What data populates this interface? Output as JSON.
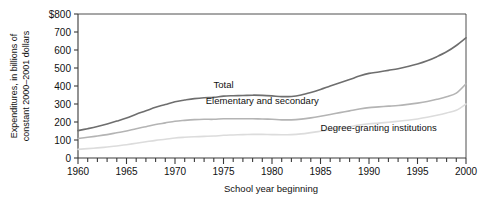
{
  "chart_data": {
    "type": "line",
    "title": "",
    "subtitle": "",
    "xlabel": "School year beginning",
    "ylabel": "Expenditures, in billions of constant 2000–2001 dollars",
    "ylabel_line1": "Expenditures, in billions of",
    "ylabel_line2": "constant 2000–2001 dollars",
    "xlim": [
      1960,
      2000
    ],
    "ylim": [
      0,
      800
    ],
    "ytick_values": [
      0,
      100,
      200,
      300,
      400,
      500,
      600,
      700,
      800
    ],
    "ytick_labels": [
      "0",
      "100",
      "200",
      "300",
      "400",
      "500",
      "600",
      "700",
      "$800"
    ],
    "xtick_values": [
      1960,
      1961,
      1962,
      1963,
      1964,
      1965,
      1966,
      1967,
      1968,
      1969,
      1970,
      1971,
      1972,
      1973,
      1974,
      1975,
      1976,
      1977,
      1978,
      1979,
      1980,
      1981,
      1982,
      1983,
      1984,
      1985,
      1986,
      1987,
      1988,
      1989,
      1990,
      1991,
      1992,
      1993,
      1994,
      1995,
      1996,
      1997,
      1998,
      1999,
      2000
    ],
    "xtick_labels": [
      "1960",
      "1965",
      "1970",
      "1975",
      "1980",
      "1985",
      "1990",
      "1995",
      "2000"
    ],
    "xtick_labeled_values": [
      1960,
      1965,
      1970,
      1975,
      1980,
      1985,
      1990,
      1995,
      2000
    ],
    "grid": false,
    "legend_position": "inline-annotations",
    "x": [
      1960,
      1961,
      1962,
      1963,
      1964,
      1965,
      1966,
      1967,
      1968,
      1969,
      1970,
      1971,
      1972,
      1973,
      1974,
      1975,
      1976,
      1977,
      1978,
      1979,
      1980,
      1981,
      1982,
      1983,
      1984,
      1985,
      1986,
      1987,
      1988,
      1989,
      1990,
      1991,
      1992,
      1993,
      1994,
      1995,
      1996,
      1997,
      1998,
      1999,
      2000
    ],
    "series": [
      {
        "name": "Total",
        "color": "#6e6e6e",
        "label_x": 1975,
        "label_y": 390,
        "values": [
          152,
          163,
          175,
          189,
          205,
          222,
          243,
          262,
          282,
          297,
          313,
          322,
          330,
          335,
          337,
          344,
          346,
          347,
          349,
          348,
          345,
          341,
          342,
          350,
          364,
          381,
          400,
          418,
          436,
          455,
          470,
          478,
          487,
          496,
          508,
          522,
          540,
          563,
          590,
          625,
          668
        ]
      },
      {
        "name": "Elementary and secondary",
        "color": "#b4b4b4",
        "label_x": 1979,
        "label_y": 300,
        "values": [
          108,
          115,
          122,
          130,
          140,
          150,
          163,
          174,
          186,
          195,
          204,
          209,
          213,
          215,
          215,
          218,
          218,
          218,
          218,
          217,
          215,
          212,
          212,
          216,
          223,
          232,
          242,
          252,
          262,
          272,
          280,
          284,
          288,
          292,
          298,
          305,
          314,
          326,
          340,
          360,
          412
        ]
      },
      {
        "name": "Degree-granting institutions",
        "color": "#dcdcdc",
        "label_x": 1991,
        "label_y": 150,
        "values": [
          48,
          52,
          56,
          61,
          67,
          74,
          82,
          90,
          98,
          104,
          111,
          115,
          118,
          120,
          122,
          126,
          128,
          130,
          131,
          131,
          130,
          129,
          130,
          134,
          141,
          149,
          158,
          166,
          174,
          183,
          190,
          194,
          199,
          204,
          210,
          217,
          226,
          237,
          250,
          265,
          300
        ]
      }
    ]
  },
  "annotations": {
    "total": "Total",
    "elementary": "Elementary and secondary",
    "degree": "Degree-granting institutions"
  },
  "axes": {
    "x_title": "School year beginning",
    "y_title_line1": "Expenditures, in billions of",
    "y_title_line2": "constant 2000–2001 dollars"
  },
  "colors": {
    "total": "#6e6e6e",
    "elementary": "#b4b4b4",
    "degree": "#dcdcdc",
    "axis": "#3a3a3a",
    "background": "#ffffff"
  }
}
